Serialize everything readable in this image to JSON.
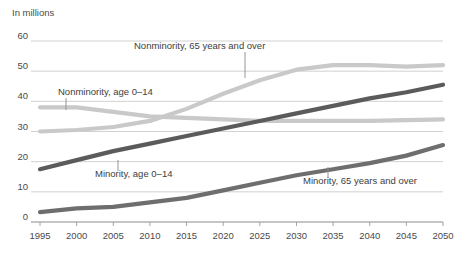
{
  "chart_data": {
    "type": "line",
    "title": "",
    "unit_note": "In millions",
    "xlabel": "",
    "ylabel": "",
    "x": [
      1995,
      2000,
      2005,
      2010,
      2015,
      2020,
      2025,
      2030,
      2035,
      2040,
      2045,
      2050
    ],
    "xlim": [
      1995,
      2050
    ],
    "ylim": [
      0,
      60
    ],
    "yticks": [
      0,
      10,
      20,
      30,
      40,
      50,
      60
    ],
    "xticks": [
      "1995",
      "2000",
      "2005",
      "2010",
      "2015",
      "2020",
      "2025",
      "2030",
      "2035",
      "2040",
      "2045",
      "2050"
    ],
    "grid": true,
    "legend": "inline-annotations",
    "series": [
      {
        "name": "Nonminority, 65 years and over",
        "color": "#c9c9c9",
        "values": [
          30.0,
          30.5,
          31.5,
          33.5,
          37.5,
          42.5,
          47.0,
          50.5,
          52.0,
          52.0,
          51.5,
          52.0
        ]
      },
      {
        "name": "Nonminority, age 0-14",
        "color": "#c9c9c9",
        "values": [
          38.0,
          38.0,
          36.5,
          35.0,
          34.5,
          34.0,
          33.5,
          33.5,
          33.5,
          33.5,
          33.8,
          34.0
        ]
      },
      {
        "name": "Minority, age 0-14",
        "color": "#5b5b5b",
        "values": [
          17.5,
          20.5,
          23.5,
          26.0,
          28.5,
          31.0,
          33.5,
          36.0,
          38.5,
          41.0,
          43.0,
          45.5
        ]
      },
      {
        "name": "Minority, 65 years and over",
        "color": "#6e6e6e",
        "values": [
          3.3,
          4.5,
          5.0,
          6.5,
          8.0,
          10.5,
          13.0,
          15.5,
          17.5,
          19.5,
          22.0,
          25.5
        ]
      }
    ],
    "annotations": [
      {
        "label": "Nonminority, 65 years and over",
        "text_x": 134,
        "text_y": 49,
        "leader_x": 245,
        "leader_y1": 52,
        "leader_y2": 78
      },
      {
        "label": "Nonminority, age 0–14",
        "text_x": 58,
        "text_y": 95,
        "leader_x": 66,
        "leader_y1": 98,
        "leader_y2": 110
      },
      {
        "label": "Minority, age 0–14",
        "text_x": 95,
        "text_y": 177,
        "leader_x": 118,
        "leader_y1": 160,
        "leader_y2": 171
      },
      {
        "label": "Minority, 65 years and over",
        "text_x": 303,
        "text_y": 184,
        "leader_x": 328,
        "leader_y1": 167,
        "leader_y2": 178
      }
    ]
  }
}
